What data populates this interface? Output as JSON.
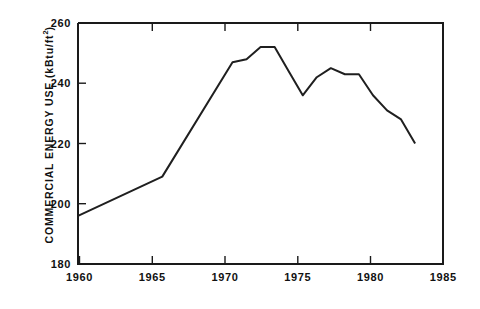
{
  "chart_data": {
    "type": "line",
    "title": "",
    "xlabel": "",
    "ylabel": "COMMERCIAL ENERGY USE (kBtu/ft2)",
    "ylabel_base": "COMMERCIAL ENERGY USE (kBtu/ft",
    "ylabel_exponent": "2",
    "ylabel_tail": ")",
    "xlim": [
      1959.0,
      1985.0
    ],
    "ylim": [
      180,
      260
    ],
    "xticks": [
      1960,
      1965,
      1970,
      1975,
      1980,
      1985
    ],
    "xtick_labels": [
      "1960",
      "1965",
      "1970",
      "1975",
      "1980",
      "1985"
    ],
    "yticks": [
      180,
      200,
      220,
      240,
      260
    ],
    "ytick_labels": [
      "180",
      "200",
      "220",
      "240",
      "260"
    ],
    "grid": false,
    "legend": false,
    "line_color": "#1f1f1f",
    "axis_color": "#1a1a1a",
    "background_color": "#ffffff",
    "x": [
      1959,
      1965,
      1970,
      1971,
      1972,
      1973,
      1974,
      1975,
      1976,
      1977,
      1978,
      1979,
      1980,
      1981,
      1982,
      1983
    ],
    "values": [
      196,
      209,
      247,
      248,
      252,
      252,
      244,
      236,
      242,
      245,
      243,
      243,
      236,
      231,
      228,
      220
    ],
    "series": [
      {
        "name": "Commercial energy use",
        "x": [
          1959,
          1965,
          1970,
          1971,
          1972,
          1973,
          1974,
          1975,
          1976,
          1977,
          1978,
          1979,
          1980,
          1981,
          1982,
          1983
        ],
        "values": [
          196,
          209,
          247,
          248,
          252,
          252,
          244,
          236,
          242,
          245,
          243,
          243,
          236,
          231,
          228,
          220
        ]
      }
    ],
    "annotations": []
  }
}
